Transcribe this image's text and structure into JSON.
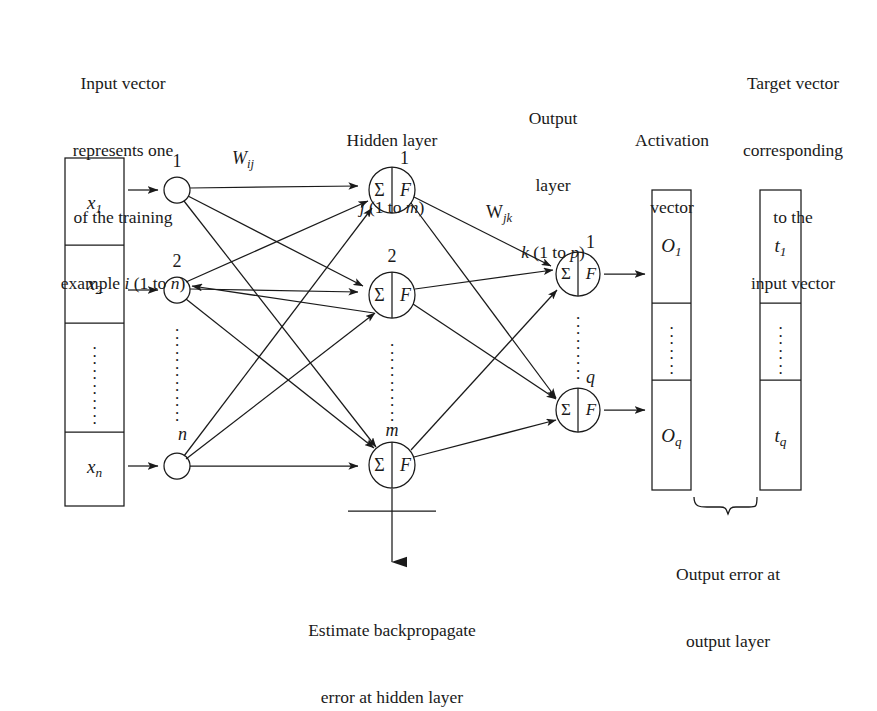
{
  "figure": {
    "type": "neural-network-architecture-diagram",
    "title_captions": {
      "input_caption": [
        "Input vector",
        "represents one",
        "of the training",
        "example i (1 to n)"
      ],
      "hidden_caption": [
        "Hidden layer",
        "j (1 to m)"
      ],
      "output_caption": [
        "Output",
        "layer",
        "k (1 to p)"
      ],
      "activation_caption": [
        "Activation",
        "vector"
      ],
      "target_caption": [
        "Target vector",
        "corresponding",
        "to the",
        "input vector"
      ]
    },
    "input_vector": {
      "name": "input-vector",
      "cells": [
        "x1",
        "⋮",
        "xn"
      ],
      "cell_labels": [
        {
          "base": "x",
          "sub": "1"
        },
        {
          "base": "x",
          "sub": "2"
        },
        {
          "base": "",
          "sub": ""
        },
        {
          "base": "x",
          "sub": "n"
        }
      ]
    },
    "input_nodes": [
      {
        "label": "1"
      },
      {
        "label": "2"
      },
      {
        "label": "n"
      }
    ],
    "hidden_nodes": [
      {
        "label": "1",
        "sum": "Σ",
        "act": "F"
      },
      {
        "label": "2",
        "sum": "Σ",
        "act": "F"
      },
      {
        "label": "m",
        "sum": "Σ",
        "act": "F"
      }
    ],
    "output_nodes": [
      {
        "label": "1",
        "sum": "Σ",
        "act": "F"
      },
      {
        "label": "q",
        "sum": "Σ",
        "act": "F"
      }
    ],
    "weights": {
      "input_to_hidden": {
        "base": "W",
        "sub": "ij"
      },
      "hidden_to_output": {
        "base": "W",
        "sub": "jk"
      }
    },
    "activation_vector": {
      "cells": [
        {
          "base": "O",
          "sub": "1"
        },
        {
          "base": "",
          "sub": ""
        },
        {
          "base": "O",
          "sub": "q"
        }
      ]
    },
    "target_vector": {
      "cells": [
        {
          "base": "t",
          "sub": "1"
        },
        {
          "base": "",
          "sub": ""
        },
        {
          "base": "t",
          "sub": "q"
        }
      ]
    },
    "annotations": {
      "backprop_note": [
        "Estimate backpropagate",
        "error at hidden layer"
      ],
      "output_error_note": [
        "Output error at",
        "output layer"
      ]
    },
    "colors": {
      "stroke": "#1a1a1a",
      "background": "#ffffff",
      "text": "#1a1a1a"
    }
  }
}
